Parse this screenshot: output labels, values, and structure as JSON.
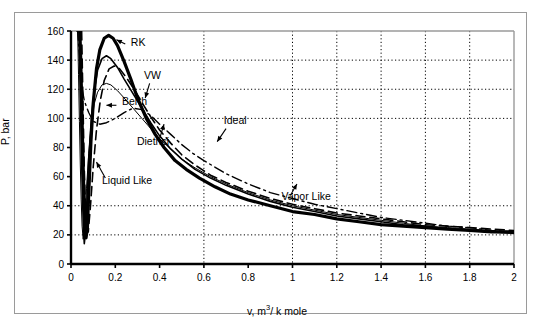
{
  "chart_data": {
    "type": "line",
    "title": "",
    "xlabel": "v, m3/ k mole",
    "xlabel_prefix": "v, m",
    "xlabel_sup": "3",
    "xlabel_suffix": "/ k mole",
    "ylabel": "P, bar",
    "xlim": [
      0,
      2
    ],
    "ylim": [
      0,
      160
    ],
    "xticks": [
      0,
      0.2,
      0.4,
      0.6,
      0.8,
      1,
      1.2,
      1.4,
      1.6,
      1.8,
      2
    ],
    "xticklabels": [
      "0",
      "0.2",
      "0.4",
      "0.6",
      "0.8",
      "1",
      "1.2",
      "1.4",
      "1.6",
      "1.8",
      "2"
    ],
    "yticks": [
      0,
      20,
      40,
      60,
      80,
      100,
      120,
      140,
      160
    ],
    "yticklabels": [
      "0",
      "20",
      "40",
      "60",
      "80",
      "100",
      "120",
      "140",
      "160"
    ],
    "grid": {
      "horizontal_dotted_at": [
        20,
        40,
        100,
        120,
        140
      ],
      "vertical_dotted_at": [
        0.6,
        1.0,
        1.2,
        1.4,
        1.6,
        1.8
      ],
      "style": "dotted"
    },
    "legend": {
      "position": "inline-annotations"
    },
    "annotations": [
      {
        "name": "RK",
        "label": "RK",
        "x": 0.27,
        "y": 150
      },
      {
        "name": "VW",
        "label": "VW",
        "x": 0.33,
        "y": 127
      },
      {
        "name": "Berth",
        "label": "Berth",
        "x": 0.23,
        "y": 109
      },
      {
        "name": "Dietrici",
        "label": "Dietrici",
        "x": 0.37,
        "y": 82
      },
      {
        "name": "Ideal",
        "label": "Ideal",
        "x": 0.69,
        "y": 96
      },
      {
        "name": "Liquid Like",
        "label": "Liquid Like",
        "x": 0.14,
        "y": 55
      },
      {
        "name": "Vapor Like",
        "label": "Vapor Like",
        "x": 0.95,
        "y": 44
      }
    ],
    "series": [
      {
        "name": "Ideal",
        "style": "dash-dot",
        "color": "#000000",
        "points": [
          [
            0.026,
            160
          ],
          [
            0.03,
            160
          ],
          [
            0.035,
            150
          ],
          [
            0.045,
            125
          ],
          [
            0.06,
            112
          ],
          [
            0.08,
            104
          ],
          [
            0.1,
            98
          ],
          [
            0.13,
            96
          ],
          [
            0.16,
            97
          ],
          [
            0.2,
            100
          ],
          [
            0.24,
            104
          ],
          [
            0.28,
            107
          ],
          [
            0.32,
            106
          ],
          [
            0.36,
            102
          ],
          [
            0.4,
            96
          ],
          [
            0.45,
            89
          ],
          [
            0.5,
            82
          ],
          [
            0.55,
            76
          ],
          [
            0.6,
            71
          ],
          [
            0.7,
            62
          ],
          [
            0.8,
            55
          ],
          [
            0.9,
            49
          ],
          [
            1.0,
            45
          ],
          [
            1.1,
            41
          ],
          [
            1.2,
            38
          ],
          [
            1.3,
            35
          ],
          [
            1.4,
            32
          ],
          [
            1.5,
            30
          ],
          [
            1.6,
            28
          ],
          [
            1.7,
            26
          ],
          [
            1.8,
            25
          ],
          [
            1.9,
            23
          ],
          [
            2.0,
            22
          ]
        ]
      },
      {
        "name": "RK",
        "style": "solid-thick",
        "color": "#000000",
        "points": [
          [
            0.04,
            160
          ],
          [
            0.044,
            140
          ],
          [
            0.048,
            112
          ],
          [
            0.052,
            85
          ],
          [
            0.056,
            60
          ],
          [
            0.06,
            40
          ],
          [
            0.064,
            25
          ],
          [
            0.068,
            18
          ],
          [
            0.074,
            25
          ],
          [
            0.08,
            48
          ],
          [
            0.09,
            84
          ],
          [
            0.1,
            110
          ],
          [
            0.115,
            134
          ],
          [
            0.13,
            147
          ],
          [
            0.15,
            155
          ],
          [
            0.17,
            157
          ],
          [
            0.19,
            155
          ],
          [
            0.21,
            150
          ],
          [
            0.24,
            139
          ],
          [
            0.27,
            127
          ],
          [
            0.3,
            114
          ],
          [
            0.34,
            100
          ],
          [
            0.38,
            89
          ],
          [
            0.42,
            80
          ],
          [
            0.47,
            71
          ],
          [
            0.52,
            65
          ],
          [
            0.58,
            59
          ],
          [
            0.65,
            53
          ],
          [
            0.72,
            48
          ],
          [
            0.8,
            44
          ],
          [
            0.9,
            40
          ],
          [
            1.0,
            36
          ],
          [
            1.1,
            34
          ],
          [
            1.2,
            31
          ],
          [
            1.3,
            29
          ],
          [
            1.4,
            27
          ],
          [
            1.5,
            26
          ],
          [
            1.6,
            25
          ],
          [
            1.7,
            24
          ],
          [
            1.8,
            23
          ],
          [
            1.9,
            22
          ],
          [
            2.0,
            22
          ]
        ]
      },
      {
        "name": "VW",
        "style": "solid",
        "color": "#000000",
        "points": [
          [
            0.036,
            160
          ],
          [
            0.04,
            132
          ],
          [
            0.044,
            100
          ],
          [
            0.048,
            70
          ],
          [
            0.052,
            45
          ],
          [
            0.056,
            25
          ],
          [
            0.06,
            14
          ],
          [
            0.066,
            22
          ],
          [
            0.072,
            45
          ],
          [
            0.08,
            72
          ],
          [
            0.092,
            100
          ],
          [
            0.105,
            119
          ],
          [
            0.12,
            133
          ],
          [
            0.14,
            141
          ],
          [
            0.16,
            143
          ],
          [
            0.18,
            141
          ],
          [
            0.21,
            135
          ],
          [
            0.24,
            127
          ],
          [
            0.28,
            117
          ],
          [
            0.32,
            107
          ],
          [
            0.36,
            97
          ],
          [
            0.4,
            88
          ],
          [
            0.45,
            79
          ],
          [
            0.5,
            72
          ],
          [
            0.56,
            65
          ],
          [
            0.63,
            59
          ],
          [
            0.7,
            54
          ],
          [
            0.8,
            48
          ],
          [
            0.9,
            43
          ],
          [
            1.0,
            39
          ],
          [
            1.1,
            36
          ],
          [
            1.2,
            33
          ],
          [
            1.3,
            31
          ],
          [
            1.4,
            29
          ],
          [
            1.5,
            27
          ],
          [
            1.6,
            26
          ],
          [
            1.7,
            24
          ],
          [
            1.8,
            23
          ],
          [
            1.9,
            22
          ],
          [
            2.0,
            21
          ]
        ]
      },
      {
        "name": "Berth",
        "style": "thin",
        "color": "#000000",
        "points": [
          [
            0.03,
            160
          ],
          [
            0.034,
            130
          ],
          [
            0.038,
            98
          ],
          [
            0.042,
            68
          ],
          [
            0.046,
            44
          ],
          [
            0.05,
            26
          ],
          [
            0.055,
            17
          ],
          [
            0.062,
            28
          ],
          [
            0.07,
            52
          ],
          [
            0.08,
            76
          ],
          [
            0.092,
            96
          ],
          [
            0.105,
            110
          ],
          [
            0.12,
            118
          ],
          [
            0.14,
            123
          ],
          [
            0.16,
            124
          ],
          [
            0.18,
            123
          ],
          [
            0.21,
            119
          ],
          [
            0.24,
            114
          ],
          [
            0.28,
            107
          ],
          [
            0.32,
            100
          ],
          [
            0.36,
            93
          ],
          [
            0.4,
            86
          ],
          [
            0.45,
            79
          ],
          [
            0.5,
            72
          ],
          [
            0.56,
            66
          ],
          [
            0.63,
            60
          ],
          [
            0.7,
            55
          ],
          [
            0.8,
            49
          ],
          [
            0.9,
            44
          ],
          [
            1.0,
            40
          ],
          [
            1.1,
            37
          ],
          [
            1.2,
            34
          ],
          [
            1.3,
            32
          ],
          [
            1.4,
            30
          ],
          [
            1.5,
            28
          ],
          [
            1.6,
            26
          ],
          [
            1.7,
            25
          ],
          [
            1.8,
            24
          ],
          [
            1.9,
            23
          ],
          [
            2.0,
            22
          ]
        ]
      },
      {
        "name": "Dietrici",
        "style": "dashed",
        "color": "#000000",
        "points": [
          [
            0.048,
            160
          ],
          [
            0.052,
            128
          ],
          [
            0.056,
            95
          ],
          [
            0.06,
            65
          ],
          [
            0.065,
            40
          ],
          [
            0.07,
            24
          ],
          [
            0.078,
            22
          ],
          [
            0.088,
            40
          ],
          [
            0.1,
            66
          ],
          [
            0.115,
            92
          ],
          [
            0.132,
            112
          ],
          [
            0.15,
            126
          ],
          [
            0.172,
            134
          ],
          [
            0.195,
            136
          ],
          [
            0.22,
            134
          ],
          [
            0.25,
            128
          ],
          [
            0.285,
            120
          ],
          [
            0.32,
            111
          ],
          [
            0.36,
            101
          ],
          [
            0.4,
            92
          ],
          [
            0.45,
            83
          ],
          [
            0.5,
            75
          ],
          [
            0.56,
            68
          ],
          [
            0.63,
            61
          ],
          [
            0.7,
            56
          ],
          [
            0.8,
            50
          ],
          [
            0.9,
            45
          ],
          [
            1.0,
            41
          ],
          [
            1.1,
            38
          ],
          [
            1.2,
            35
          ],
          [
            1.3,
            33
          ],
          [
            1.4,
            31
          ],
          [
            1.5,
            29
          ],
          [
            1.6,
            27
          ],
          [
            1.7,
            26
          ],
          [
            1.8,
            25
          ],
          [
            1.9,
            24
          ],
          [
            2.0,
            23
          ]
        ]
      }
    ]
  },
  "axes": {
    "y_title": "P, bar",
    "x_title_prefix": "v, m",
    "x_title_sup": "3",
    "x_title_suffix": "/ k mole"
  },
  "labels": {
    "rk": "RK",
    "vw": "VW",
    "berth": "Berth",
    "dietrici": "Dietrici",
    "ideal": "Ideal",
    "liquid_like": "Liquid Like",
    "vapor_like": "Vapor Like"
  },
  "colors": {
    "axis": "#000000",
    "grid": "#000000",
    "frame": "#9a9a9a",
    "background": "#ffffff"
  }
}
